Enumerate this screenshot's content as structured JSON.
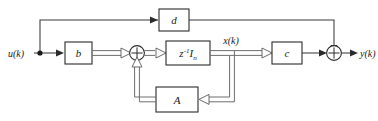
{
  "diagram": {
    "background_color": "#ffffff",
    "line_color": "#3a3a3a",
    "vector_line_color": "#6e6e6e",
    "box_stroke_color": "#2b2b2b",
    "text_color": "#1a1a1a"
  },
  "signals": {
    "input_label": "u(k)",
    "state_label": "x(k)",
    "output_label": "y(k)"
  },
  "blocks": {
    "b": {
      "label": "b"
    },
    "delay": {
      "label_base": "z",
      "label_sup": "-1",
      "label_mat": "I",
      "label_sub": "n"
    },
    "c": {
      "label": "c"
    },
    "d": {
      "label": "d"
    },
    "a": {
      "label": "A"
    }
  },
  "junctions": {
    "sum_state": {
      "symbol": "+"
    },
    "sum_output": {
      "symbol": "+"
    },
    "input_tap": {
      "symbol": "node"
    }
  }
}
